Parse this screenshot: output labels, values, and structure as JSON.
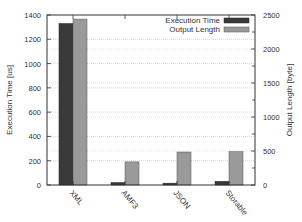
{
  "chart_data": {
    "type": "bar",
    "title": "",
    "categories": [
      "XML",
      "AMF3",
      "JSON",
      "Storable"
    ],
    "series": [
      {
        "name": "Execution Time",
        "axis": "left",
        "color": "#3a3a3a",
        "values": [
          1330,
          20,
          15,
          30
        ]
      },
      {
        "name": "Output Length",
        "axis": "right",
        "color": "#9a9a9a",
        "values": [
          2440,
          340,
          485,
          490
        ]
      }
    ],
    "xlabel": "",
    "ylabel": "Execution Time [us]",
    "ylabel_right": "Output Length [byte]",
    "ylim": [
      0,
      1400
    ],
    "ylim_right": [
      0,
      2500
    ],
    "yticks": [
      0,
      200,
      400,
      600,
      800,
      1000,
      1200,
      1400
    ],
    "yticks_right": [
      0,
      500,
      1000,
      1500,
      2000,
      2500
    ],
    "grid": true,
    "legend_position": "top-right"
  },
  "legend": {
    "items": [
      "Execution Time",
      "Output Length"
    ]
  },
  "axes": {
    "left_label": "Execution Time [us]",
    "right_label": "Output Length [byte]"
  }
}
